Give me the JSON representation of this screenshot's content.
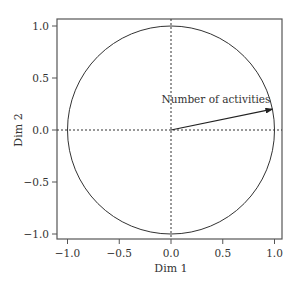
{
  "chart_data": {
    "type": "scatter",
    "subtype": "correlation-circle",
    "title": "",
    "xlabel": "Dim 1",
    "ylabel": "Dim 2",
    "xlim": [
      -1.05,
      1.05
    ],
    "ylim": [
      -1.05,
      1.05
    ],
    "xticks": [
      "-1.0",
      "-0.5",
      "0.0",
      "0.5",
      "1.0"
    ],
    "yticks": [
      "-1.0",
      "-0.5",
      "0.0",
      "0.5",
      "1.0"
    ],
    "grid": false,
    "reference_lines": {
      "x": 0,
      "y": 0,
      "style": "dotted"
    },
    "unit_circle": {
      "center": [
        0,
        0
      ],
      "radius": 1
    },
    "vectors": [
      {
        "label": "Number of activities",
        "x": 0.98,
        "y": 0.2
      }
    ]
  },
  "colors": {
    "axis": "#555555",
    "line": "#333333",
    "text": "#333333",
    "background": "#ffffff"
  }
}
